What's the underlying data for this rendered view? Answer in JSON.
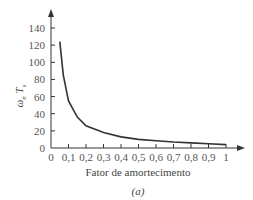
{
  "chart_data": {
    "type": "line",
    "title": "",
    "xlabel": "Fator de amortecimento",
    "ylabel": "ω_n T_s",
    "caption": "(a)",
    "xlim": [
      0,
      1
    ],
    "ylim": [
      0,
      140
    ],
    "x_ticks": [
      "0",
      "0,1",
      "0,2",
      "0,3",
      "0,4",
      "0,5",
      "0,6",
      "0,7",
      "0,8",
      "0,9",
      "1"
    ],
    "y_ticks": [
      "0",
      "20",
      "40",
      "60",
      "80",
      "100",
      "120",
      "140"
    ],
    "grid": false,
    "series": [
      {
        "name": "ω_n T_s",
        "x": [
          0.05,
          0.07,
          0.1,
          0.15,
          0.2,
          0.3,
          0.4,
          0.5,
          0.6,
          0.7,
          0.8,
          0.9,
          1.0
        ],
        "values": [
          124,
          85,
          55,
          36,
          26,
          18,
          13,
          10,
          8.5,
          7,
          6,
          5,
          4
        ]
      }
    ]
  }
}
